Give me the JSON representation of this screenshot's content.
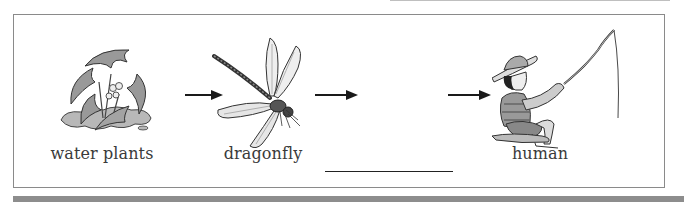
{
  "diagram": {
    "type": "food-chain",
    "nodes": [
      {
        "id": "water-plants",
        "label": "water plants",
        "icon": "water-plants-icon"
      },
      {
        "id": "dragonfly",
        "label": "dragonfly",
        "icon": "dragonfly-icon"
      },
      {
        "id": "blank",
        "label": "",
        "icon": null,
        "is_blank": true
      },
      {
        "id": "human",
        "label": "human",
        "icon": "fishing-boy-icon"
      }
    ],
    "edges": [
      {
        "from": "water-plants",
        "to": "dragonfly"
      },
      {
        "from": "dragonfly",
        "to": "blank"
      },
      {
        "from": "blank",
        "to": "human"
      }
    ]
  },
  "colors": {
    "border": "#8a8a8a",
    "text": "#3a3a3a",
    "arrow": "#1a1a1a",
    "bottom_bar": "#8d8d8d"
  }
}
